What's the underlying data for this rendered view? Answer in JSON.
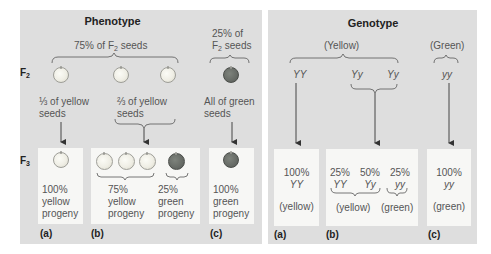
{
  "phenotype": {
    "title": "Phenotype",
    "f2_label": "F",
    "f2_sub": "2",
    "f3_label": "F",
    "f3_sub": "3",
    "yellow_group": {
      "pct_text": "75% of F",
      "sub": "2",
      "suffix": " seeds"
    },
    "green_group": {
      "line1": "25% of",
      "line2_prefix": "F",
      "line2_sub": "2",
      "line2_suffix": " seeds"
    },
    "a": {
      "desc_line1": "⅓ of yellow",
      "desc_line2": "seeds",
      "result_pct": "100%",
      "result_color": "yellow",
      "result_word": "progeny",
      "label": "(a)"
    },
    "b": {
      "desc_line1": "⅔ of yellow",
      "desc_line2": "seeds",
      "yellow_pct": "75%",
      "yellow_color": "yellow",
      "yellow_word": "progeny",
      "green_pct": "25%",
      "green_color": "green",
      "green_word": "progeny",
      "label": "(b)"
    },
    "c": {
      "desc_line1": "All of green",
      "desc_line2": "seeds",
      "result_pct": "100%",
      "result_color": "green",
      "result_word": "progeny",
      "label": "(c)"
    }
  },
  "genotype": {
    "title": "Genotype",
    "yellow_group": "(Yellow)",
    "green_group": "(Green)",
    "f2": [
      "YY",
      "Yy",
      "Yy",
      "yy"
    ],
    "a": {
      "pct": "100%",
      "geno": "YY",
      "pheno": "(yellow)",
      "label": "(a)"
    },
    "b": {
      "items": [
        {
          "pct": "25%",
          "geno": "YY"
        },
        {
          "pct": "50%",
          "geno": "Yy"
        },
        {
          "pct": "25%",
          "geno": "yy"
        }
      ],
      "yellow_pheno": "(yellow)",
      "green_pheno": "(green)",
      "label": "(b)"
    },
    "c": {
      "pct": "100%",
      "geno": "yy",
      "pheno": "(green)",
      "label": "(c)"
    }
  },
  "colors": {
    "panel_bg": "#dedede",
    "box_bg": "#f7f7f5",
    "yellow_seed": "#efeee5",
    "green_seed": "#676b66"
  }
}
